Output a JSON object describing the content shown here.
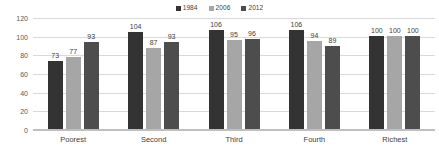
{
  "chart_data": {
    "type": "bar",
    "title": "",
    "subtitle": "",
    "xlabel": "",
    "ylabel": "",
    "categories": [
      "Poorest",
      "Second",
      "Third",
      "Fourth",
      "Richest"
    ],
    "series": [
      {
        "name": "1984",
        "color": "#333333",
        "values": [
          73,
          104,
          106,
          106,
          100
        ]
      },
      {
        "name": "2006",
        "color": "#a6a6a6",
        "values": [
          77,
          87,
          95,
          94,
          100
        ]
      },
      {
        "name": "2012",
        "color": "#4d4d4d",
        "values": [
          93,
          93,
          96,
          89,
          100
        ]
      }
    ],
    "ylim": [
      0,
      120
    ],
    "ytick_step": 20,
    "yticks": [
      120,
      100,
      80,
      60,
      40,
      20,
      0
    ],
    "grid": true,
    "grid_axis": "y",
    "legend": true,
    "legend_position": "top-center",
    "data_labels": true,
    "background_color": "#ffffff",
    "gridline_color": "#d9d9d9",
    "text_color": "#404040"
  }
}
